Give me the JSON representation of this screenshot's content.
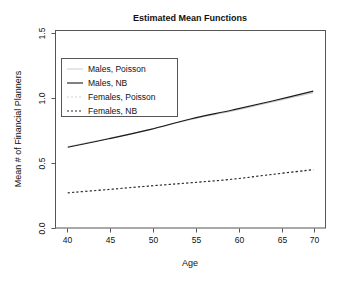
{
  "chart_data": {
    "type": "line",
    "title": "Estimated Mean Functions",
    "xlabel": "Age",
    "ylabel": "Mean # of Financial Planners",
    "xlim": [
      38.5,
      71.5
    ],
    "ylim": [
      -0.04,
      1.55
    ],
    "xticks": [
      40,
      45,
      50,
      55,
      60,
      65,
      70
    ],
    "xtick_labels": [
      "40",
      "45",
      "50",
      "55",
      "60",
      "65",
      "70"
    ],
    "yticks": [
      0.0,
      0.5,
      1.0,
      1.5
    ],
    "ytick_labels": [
      "0.0",
      "0.5",
      "1.0",
      "1.5"
    ],
    "grid": false,
    "legend_position": "upper-left",
    "x": [
      40,
      45,
      50,
      55,
      60,
      65,
      70
    ],
    "series": [
      {
        "name": "Males, Poisson",
        "style": "solid-faint",
        "color": "#c9c9c9",
        "values": [
          0.615,
          0.68,
          0.752,
          0.833,
          0.9,
          0.975,
          1.05
        ]
      },
      {
        "name": "Males, NB",
        "style": "solid",
        "color": "#1a1a1a",
        "values": [
          0.61,
          0.678,
          0.752,
          0.838,
          0.908,
          0.982,
          1.062
        ]
      },
      {
        "name": "Females, Poisson",
        "style": "dotted-faint",
        "color": "#cfcfcf",
        "values": [
          0.245,
          0.272,
          0.3,
          0.325,
          0.352,
          0.39,
          0.425
        ]
      },
      {
        "name": "Females, NB",
        "style": "dotted",
        "color": "#2a2a2a",
        "values": [
          0.243,
          0.27,
          0.298,
          0.324,
          0.352,
          0.392,
          0.43
        ]
      }
    ]
  },
  "legend": {
    "entries": [
      {
        "label": "Males, Poisson"
      },
      {
        "label": "Males, NB"
      },
      {
        "label": "Females, Poisson"
      },
      {
        "label": "Females, NB"
      }
    ]
  },
  "colors": {
    "background": "#ffffff",
    "frame": "#555555",
    "ink": "#111111",
    "faint": "#c9c9c9"
  }
}
